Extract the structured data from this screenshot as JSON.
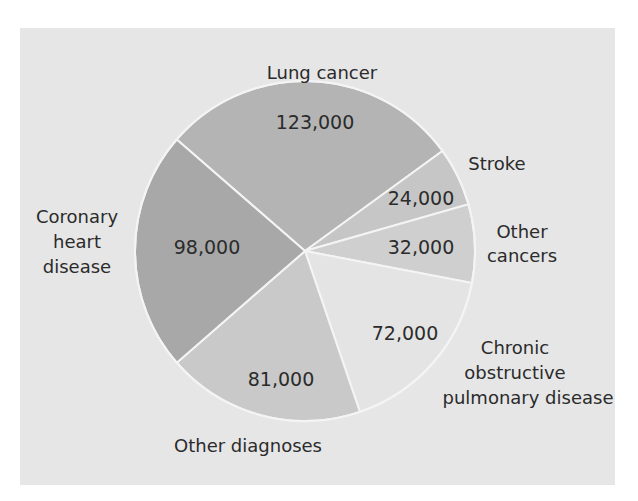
{
  "chart_data": {
    "type": "pie",
    "title": "",
    "categories": [
      "Lung cancer",
      "Stroke",
      "Other cancers",
      "Chronic obstructive pulmonary disease",
      "Other diagnoses",
      "Coronary heart disease"
    ],
    "values": [
      123000,
      24000,
      32000,
      72000,
      81000,
      98000
    ],
    "value_labels": [
      "123,000",
      "24,000",
      "32,000",
      "72,000",
      "81,000",
      "98,000"
    ],
    "total": 430000,
    "start_angle_deg": -139,
    "direction": "clockwise",
    "legend": "none (labels placed outside slices)",
    "colors": [
      "#b4b4b4",
      "#c6c6c6",
      "#cfcfcf",
      "#e4e4e4",
      "#c9c9c9",
      "#a8a8a8"
    ]
  },
  "labels": {
    "lung": [
      "Lung cancer"
    ],
    "stroke": [
      "Stroke"
    ],
    "other_cancers": [
      "Other",
      "cancers"
    ],
    "copd": [
      "Chronic",
      "obstructive",
      "pulmonary disease"
    ],
    "other_diagnoses": [
      "Other diagnoses"
    ],
    "coronary": [
      "Coronary",
      "heart",
      "disease"
    ]
  },
  "style": {
    "panel_bg": "#e6e6e6",
    "page_bg": "#ffffff",
    "divider": "#f4f4f4",
    "text": "#2b2b2b"
  }
}
